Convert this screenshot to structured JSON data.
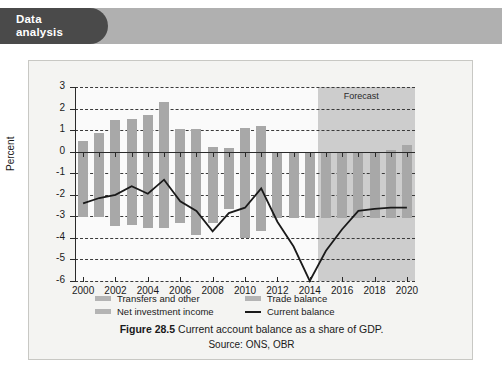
{
  "header": {
    "tab_line1": "Data",
    "tab_line2": "analysis",
    "tab_color": "#4a4a4a",
    "band_color": "#b0b0b0"
  },
  "caption": {
    "figure_number": "Figure 28.5",
    "title": "Current account balance as a share of GDP.",
    "source": "Source: ONS, OBR"
  },
  "legend": {
    "items": [
      {
        "label": "Transfers and other",
        "type": "swatch",
        "color": "#b4b4b4"
      },
      {
        "label": "Trade balance",
        "type": "swatch",
        "color": "#b4b4b4"
      },
      {
        "label": "Net investment income",
        "type": "swatch",
        "color": "#b4b4b4"
      },
      {
        "label": "Current balance",
        "type": "line",
        "color": "#1a1a1a"
      }
    ]
  },
  "chart_data": {
    "type": "bar",
    "title": "Current account balance as a share of GDP.",
    "xlabel": "",
    "ylabel": "Percent",
    "ylim": [
      -6,
      3
    ],
    "yticks": [
      3,
      2,
      1,
      0,
      -1,
      -2,
      -3,
      -4,
      -5,
      -6
    ],
    "ytick_labels": [
      "3",
      "2",
      "1",
      "0",
      "-1",
      "-2",
      "-3",
      "-4",
      "-5",
      "-6"
    ],
    "xlim": [
      1999.5,
      2020.5
    ],
    "xticks": [
      2000,
      2002,
      2004,
      2006,
      2008,
      2010,
      2012,
      2014,
      2016,
      2018,
      2020
    ],
    "xtick_labels": [
      "2000",
      "2002",
      "2004",
      "2006",
      "2008",
      "2010",
      "2012",
      "2014",
      "2016",
      "2018",
      "2020"
    ],
    "grid": true,
    "legend_position": "below-axis",
    "annotations": [
      {
        "text": "Forecast",
        "x_start": 2014.5,
        "x_end": 2020.5,
        "shaded": true,
        "shade_color": "#c4c4c4"
      }
    ],
    "categories": [
      2000,
      2001,
      2002,
      2003,
      2004,
      2005,
      2006,
      2007,
      2008,
      2009,
      2010,
      2011,
      2012,
      2013,
      2014,
      2015,
      2016,
      2017,
      2018,
      2019,
      2020
    ],
    "series": [
      {
        "name": "Positive components (transfers and other / net investment income)",
        "bar_color": "#a8a8a8",
        "values": [
          0.5,
          0.85,
          1.45,
          1.5,
          1.7,
          2.3,
          1.05,
          1.05,
          0.2,
          0.15,
          1.1,
          1.2,
          0.0,
          0.0,
          0.0,
          0.0,
          0.0,
          0.0,
          0.0,
          0.1,
          0.3
        ]
      },
      {
        "name": "Negative components (trade balance)",
        "bar_color": "#a8a8a8",
        "values": [
          -3.05,
          -3.05,
          -3.45,
          -3.4,
          -3.55,
          -3.55,
          -3.3,
          -3.85,
          -3.3,
          -2.65,
          -4.0,
          -3.7,
          -3.1,
          -3.1,
          -3.1,
          -3.1,
          -3.1,
          -3.1,
          -3.1,
          -3.1,
          -3.1
        ]
      },
      {
        "name": "Current balance",
        "type": "line",
        "line_color": "#1a1a1a",
        "values": [
          -2.4,
          -2.15,
          -2.0,
          -1.6,
          -1.95,
          -1.3,
          -2.3,
          -2.75,
          -3.7,
          -2.85,
          -2.6,
          -1.7,
          -3.25,
          -4.4,
          -6.0,
          -4.6,
          -3.6,
          -2.75,
          -2.65,
          -2.6,
          -2.6
        ]
      }
    ]
  }
}
